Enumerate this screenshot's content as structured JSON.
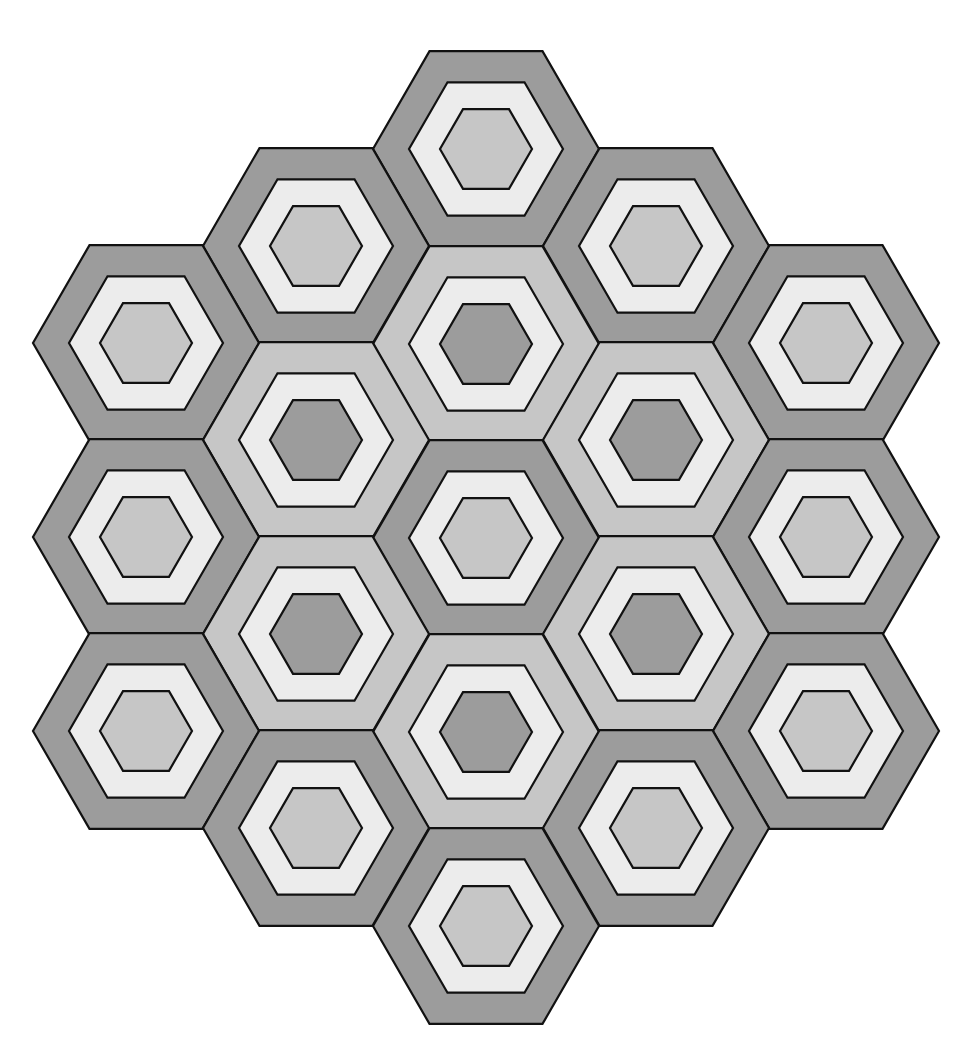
{
  "diagram": {
    "type": "hexagonal-tessellation",
    "geometry": {
      "outer_radius": 113,
      "middle_radius": 77,
      "inner_radius": 46
    },
    "colors": {
      "dark": "#9c9c9c",
      "mid": "#c6c6c6",
      "light": "#ececec",
      "stroke": "#111111",
      "background": "#ffffff"
    },
    "tile_styles": {
      "dark-outer": {
        "outer": "dark",
        "middle": "light",
        "inner": "mid"
      },
      "mid-outer": {
        "outer": "mid",
        "middle": "light",
        "inner": "dark"
      }
    },
    "tiles": [
      {
        "id": "top",
        "cx": 486,
        "cy": 149,
        "style": "dark-outer"
      },
      {
        "id": "upper-left",
        "cx": 316,
        "cy": 246,
        "style": "dark-outer"
      },
      {
        "id": "upper-right",
        "cx": 656,
        "cy": 246,
        "style": "dark-outer"
      },
      {
        "id": "far-left-top",
        "cx": 146,
        "cy": 343,
        "style": "dark-outer"
      },
      {
        "id": "far-right-top",
        "cx": 826,
        "cy": 343,
        "style": "dark-outer"
      },
      {
        "id": "inner-top",
        "cx": 486,
        "cy": 344,
        "style": "mid-outer"
      },
      {
        "id": "inner-upper-left",
        "cx": 316,
        "cy": 440,
        "style": "mid-outer"
      },
      {
        "id": "inner-upper-right",
        "cx": 656,
        "cy": 440,
        "style": "mid-outer"
      },
      {
        "id": "center",
        "cx": 486,
        "cy": 538,
        "style": "dark-outer"
      },
      {
        "id": "far-left-mid",
        "cx": 146,
        "cy": 537,
        "style": "dark-outer"
      },
      {
        "id": "far-right-mid",
        "cx": 826,
        "cy": 537,
        "style": "dark-outer"
      },
      {
        "id": "inner-lower-left",
        "cx": 316,
        "cy": 634,
        "style": "mid-outer"
      },
      {
        "id": "inner-lower-right",
        "cx": 656,
        "cy": 634,
        "style": "mid-outer"
      },
      {
        "id": "inner-bottom",
        "cx": 486,
        "cy": 732,
        "style": "mid-outer"
      },
      {
        "id": "far-left-bottom",
        "cx": 146,
        "cy": 731,
        "style": "dark-outer"
      },
      {
        "id": "far-right-bottom",
        "cx": 826,
        "cy": 731,
        "style": "dark-outer"
      },
      {
        "id": "lower-left",
        "cx": 316,
        "cy": 828,
        "style": "dark-outer"
      },
      {
        "id": "lower-right",
        "cx": 656,
        "cy": 828,
        "style": "dark-outer"
      },
      {
        "id": "bottom",
        "cx": 486,
        "cy": 926,
        "style": "dark-outer"
      }
    ]
  }
}
